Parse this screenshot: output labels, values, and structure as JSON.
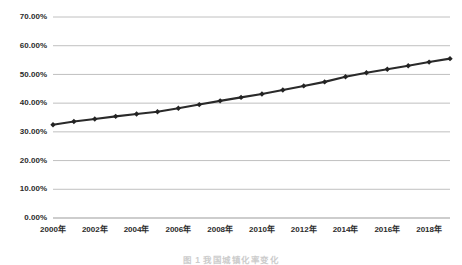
{
  "chart_data": {
    "type": "line",
    "title": "",
    "xlabel": "",
    "ylabel": "",
    "x": [
      2000,
      2001,
      2002,
      2003,
      2004,
      2005,
      2006,
      2007,
      2008,
      2009,
      2010,
      2011,
      2012,
      2013,
      2014,
      2015,
      2016,
      2017,
      2018,
      2019
    ],
    "values": [
      32.5,
      33.6,
      34.5,
      35.4,
      36.2,
      37.0,
      38.2,
      39.5,
      40.8,
      42.0,
      43.2,
      44.6,
      46.0,
      47.4,
      49.2,
      50.6,
      51.8,
      53.0,
      54.3,
      55.5
    ],
    "series": [
      {
        "name": "series-1",
        "values": [
          32.5,
          33.6,
          34.5,
          35.4,
          36.2,
          37.0,
          38.2,
          39.5,
          40.8,
          42.0,
          43.2,
          44.6,
          46.0,
          47.4,
          49.2,
          50.6,
          51.8,
          53.0,
          54.3,
          55.5
        ]
      }
    ],
    "ylim": [
      0,
      70
    ],
    "xlim": [
      2000,
      2019
    ],
    "ytick_values": [
      0,
      10,
      20,
      30,
      40,
      50,
      60,
      70
    ],
    "ytick_labels": [
      "0.00%",
      "10.00%",
      "20.00%",
      "30.00%",
      "40.00%",
      "50.00%",
      "60.00%",
      "70.00%"
    ],
    "xtick_values": [
      2000,
      2002,
      2004,
      2006,
      2008,
      2010,
      2012,
      2014,
      2016,
      2018
    ],
    "xtick_labels": [
      "2000年",
      "2002年",
      "2004年",
      "2006年",
      "2008年",
      "2010年",
      "2012年",
      "2014年",
      "2016年",
      "2018年"
    ],
    "grid": true,
    "grid_axis": "y",
    "legend": false,
    "legend_position": "none",
    "marker": "diamond",
    "line_color": "#2a2a2a",
    "marker_color": "#232323",
    "grid_color": "#b9b9b9",
    "background_color": "#ffffff"
  },
  "caption": {
    "text": "图 1 我国城镇化率变化"
  }
}
